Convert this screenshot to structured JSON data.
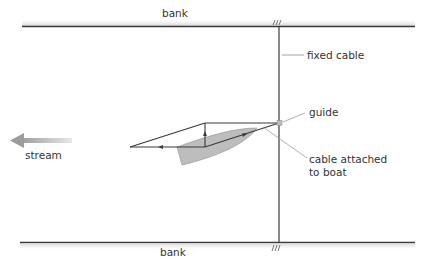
{
  "diagram": {
    "labels": {
      "bank_top": "bank",
      "bank_bottom": "bank",
      "fixed_cable": "fixed cable",
      "guide": "guide",
      "cable_attached_line1": "cable attached",
      "cable_attached_line2": "to boat",
      "stream": "stream"
    },
    "icons": {
      "stream_arrow": "left-arrow",
      "anchor_marks": "hatch-marks"
    },
    "colors": {
      "line": "#3a3a3a",
      "leader": "#9a9a9a",
      "boat_fill": "#bdbdbd",
      "stream_arrow": "#a8a8a8",
      "text": "#333333"
    }
  }
}
